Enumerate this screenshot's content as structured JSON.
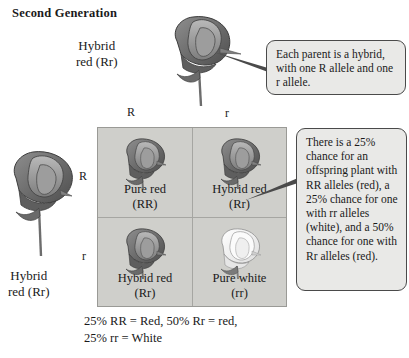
{
  "figure": {
    "title": "Second Generation",
    "caption_line_1": "25% RR = Red, 50% Rr = red,",
    "caption_line_2": "25% rr = White"
  },
  "parents": {
    "top": {
      "label_line_1": "Hybrid",
      "label_line_2": "red (Rr)",
      "flower_icon": "pea-flower-red-icon"
    },
    "left": {
      "label_line_1": "Hybrid",
      "label_line_2": "red (Rr)",
      "flower_icon": "pea-flower-red-icon"
    }
  },
  "punnett": {
    "top_alleles": [
      "R",
      "r"
    ],
    "left_alleles": [
      "R",
      "r"
    ],
    "cells": [
      {
        "position": "top-left",
        "name": "Pure red",
        "genotype": "(RR)",
        "flower_icon": "pea-flower-red-icon",
        "color": "#6f6f6f"
      },
      {
        "position": "top-right",
        "name": "Hybrid red",
        "genotype": "(Rr)",
        "flower_icon": "pea-flower-red-icon",
        "color": "#6f6f6f"
      },
      {
        "position": "bottom-left",
        "name": "Hybrid red",
        "genotype": "(Rr)",
        "flower_icon": "pea-flower-red-icon",
        "color": "#6f6f6f"
      },
      {
        "position": "bottom-right",
        "name": "Pure white",
        "genotype": "(rr)",
        "flower_icon": "pea-flower-white-icon",
        "color": "#f2f2f0"
      }
    ]
  },
  "callouts": [
    {
      "id": "parent-hybrid-note",
      "text": "Each parent is a hybrid, with one R allele and one r allele."
    },
    {
      "id": "offspring-probability-note",
      "text": "There is a 25% chance for an offspring plant with RR alleles (red), a 25% chance for one with rr alleles (white), and a 50% chance for one with Rr alleles (red)."
    }
  ],
  "colors": {
    "grid_background": "#cfcfcb",
    "grid_line": "#a6a6a2",
    "callout_background": "#e9e9e7",
    "callout_border": "#4a4a4a",
    "text": "#1a1a1a"
  }
}
